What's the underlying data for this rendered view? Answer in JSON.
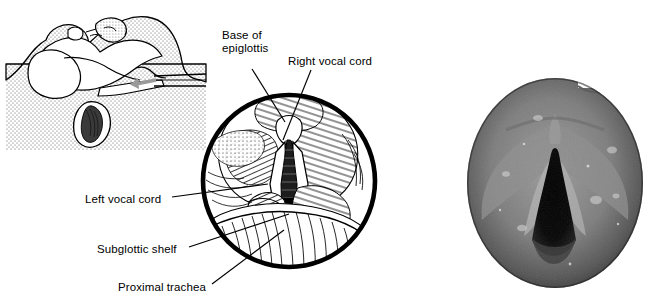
{
  "figure": {
    "kind": "medical-illustration",
    "panels": [
      {
        "id": "sagittal",
        "name": "sagittal-head-neck-diagram",
        "type": "line-drawing"
      },
      {
        "id": "laryngoscopic",
        "name": "laryngoscopic-view-illustration",
        "type": "line-drawing"
      },
      {
        "id": "photo",
        "name": "endoscopic-photograph",
        "type": "grayscale-photograph"
      }
    ]
  },
  "labels": {
    "base_of_epiglottis": "Base of\nepiglottis",
    "right_vocal_cord": "Right vocal cord",
    "left_vocal_cord": "Left vocal cord",
    "subglottic_shelf": "Subglottic shelf",
    "proximal_trachea": "Proximal trachea"
  },
  "colors": {
    "ink": "#000000",
    "background": "#ffffff",
    "stipple": "#6a6a6a",
    "arrow": "#9a9a9a",
    "photo_mid": "#7a7a7a",
    "photo_dark": "#0b0b0b",
    "photo_light": "#b9b9b9"
  }
}
